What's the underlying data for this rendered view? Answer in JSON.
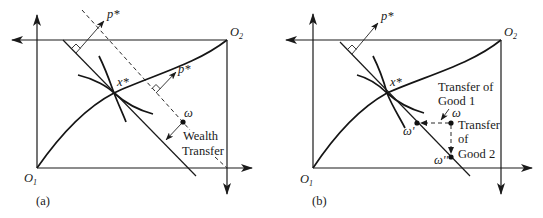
{
  "figure": {
    "panels": [
      {
        "id": "a",
        "caption": "(a)",
        "origin1_label": "O",
        "origin1_sub": "1",
        "origin2_label": "O",
        "origin2_sub": "2",
        "equilibrium_label": "x*",
        "price_label_1": "p*",
        "price_label_2": "p*",
        "endowment_label": "ω",
        "annotation_line1": "Wealth",
        "annotation_line2": "Transfer"
      },
      {
        "id": "b",
        "caption": "(b)",
        "origin1_label": "O",
        "origin1_sub": "1",
        "origin2_label": "O",
        "origin2_sub": "2",
        "equilibrium_label": "x*",
        "price_label": "p*",
        "endowment_label": "ω",
        "endowment_prime_label": "ω'",
        "endowment_double_prime_label": "ω''",
        "transfer1_line1": "Transfer of",
        "transfer1_line2": "Good 1",
        "transfer2_line1": "Transfer",
        "transfer2_line2": "of",
        "transfer2_line3": "Good 2"
      }
    ]
  }
}
